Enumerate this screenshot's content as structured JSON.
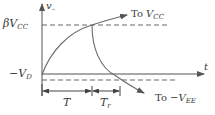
{
  "diagram": {
    "title": "",
    "colors": {
      "stroke": "#555555",
      "curve": "#6a6a6a",
      "text": "#3a3a3a",
      "background": "#ffffff"
    },
    "axes": {
      "y_label_main": "v",
      "y_label_sub": "–",
      "x_label": "t"
    },
    "levels": {
      "top_label_main": "βV",
      "top_label_sub": "CC",
      "bottom_label_main": "−V",
      "bottom_label_sub": "D"
    },
    "annotations": {
      "to_vcc_prefix": "To ",
      "to_vcc_main": "V",
      "to_vcc_sub": "CC",
      "to_vee_prefix": "To −",
      "to_vee_main": "V",
      "to_vee_sub": "EE"
    },
    "intervals": {
      "t_label": "T",
      "tr_label_main": "T",
      "tr_label_sub": "r"
    }
  }
}
